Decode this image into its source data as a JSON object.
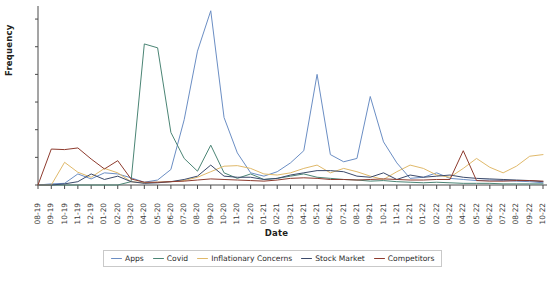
{
  "chart_data": {
    "type": "line",
    "title": "",
    "xlabel": "Date",
    "ylabel": "Frequency",
    "ylim": [
      0,
      320
    ],
    "yticks": [
      0,
      50,
      100,
      150,
      200,
      250,
      300
    ],
    "grid": false,
    "legend_position": "bottom",
    "categories": [
      "08-19",
      "09-19",
      "10-19",
      "11-19",
      "12-19",
      "01-20",
      "02-20",
      "03-20",
      "04-20",
      "05-20",
      "06-20",
      "07-20",
      "08-20",
      "09-20",
      "10-20",
      "11-20",
      "12-20",
      "01-21",
      "02-21",
      "03-21",
      "04-21",
      "05-21",
      "06-21",
      "07-21",
      "08-21",
      "09-21",
      "10-21",
      "11-21",
      "12-21",
      "01-22",
      "02-22",
      "03-22",
      "04-22",
      "05-22",
      "06-22",
      "07-22",
      "08-22",
      "09-22",
      "10-22"
    ],
    "series": [
      {
        "name": "Apps",
        "color": "#6b8ec4",
        "values": [
          0,
          2,
          3,
          20,
          11,
          22,
          20,
          13,
          5,
          9,
          28,
          118,
          242,
          315,
          122,
          58,
          22,
          16,
          24,
          40,
          62,
          200,
          55,
          42,
          48,
          160,
          78,
          40,
          12,
          14,
          22,
          12,
          10,
          8,
          9,
          8,
          7,
          6,
          4
        ]
      },
      {
        "name": "Covid",
        "color": "#4b8575",
        "values": [
          0,
          0,
          0,
          0,
          0,
          0,
          0,
          6,
          255,
          248,
          95,
          48,
          25,
          72,
          22,
          12,
          20,
          10,
          12,
          16,
          20,
          14,
          12,
          10,
          9,
          7,
          8,
          6,
          5,
          4,
          5,
          4,
          3,
          3,
          3,
          2,
          2,
          2,
          2
        ]
      },
      {
        "name": "Inflationary Concerns",
        "color": "#e0b96a",
        "values": [
          0,
          0,
          41,
          23,
          14,
          30,
          22,
          6,
          4,
          5,
          6,
          8,
          14,
          24,
          34,
          35,
          30,
          20,
          18,
          22,
          30,
          36,
          22,
          30,
          24,
          16,
          10,
          24,
          36,
          30,
          18,
          14,
          30,
          48,
          32,
          22,
          34,
          52,
          55
        ]
      },
      {
        "name": "Stock Market",
        "color": "#3b4a6b",
        "values": [
          0,
          0,
          2,
          6,
          20,
          10,
          16,
          6,
          3,
          4,
          6,
          10,
          16,
          36,
          16,
          14,
          14,
          10,
          12,
          18,
          22,
          26,
          26,
          24,
          16,
          14,
          22,
          10,
          18,
          14,
          16,
          18,
          14,
          12,
          11,
          10,
          9,
          8,
          6
        ]
      },
      {
        "name": "Competitors",
        "color": "#8e3b2e",
        "values": [
          0,
          65,
          64,
          67,
          47,
          29,
          44,
          11,
          5,
          5,
          6,
          7,
          9,
          11,
          10,
          9,
          8,
          7,
          9,
          12,
          13,
          12,
          10,
          10,
          9,
          10,
          11,
          10,
          9,
          9,
          10,
          10,
          62,
          8,
          7,
          7,
          8,
          8,
          7
        ]
      }
    ]
  },
  "legend": {
    "items": [
      {
        "label": "Apps",
        "color": "#6b8ec4"
      },
      {
        "label": "Covid",
        "color": "#4b8575"
      },
      {
        "label": "Inflationary Concerns",
        "color": "#e0b96a"
      },
      {
        "label": "Stock Market",
        "color": "#3b4a6b"
      },
      {
        "label": "Competitors",
        "color": "#8e3b2e"
      }
    ]
  },
  "axes": {
    "axis_color": "#4a4a4a"
  }
}
